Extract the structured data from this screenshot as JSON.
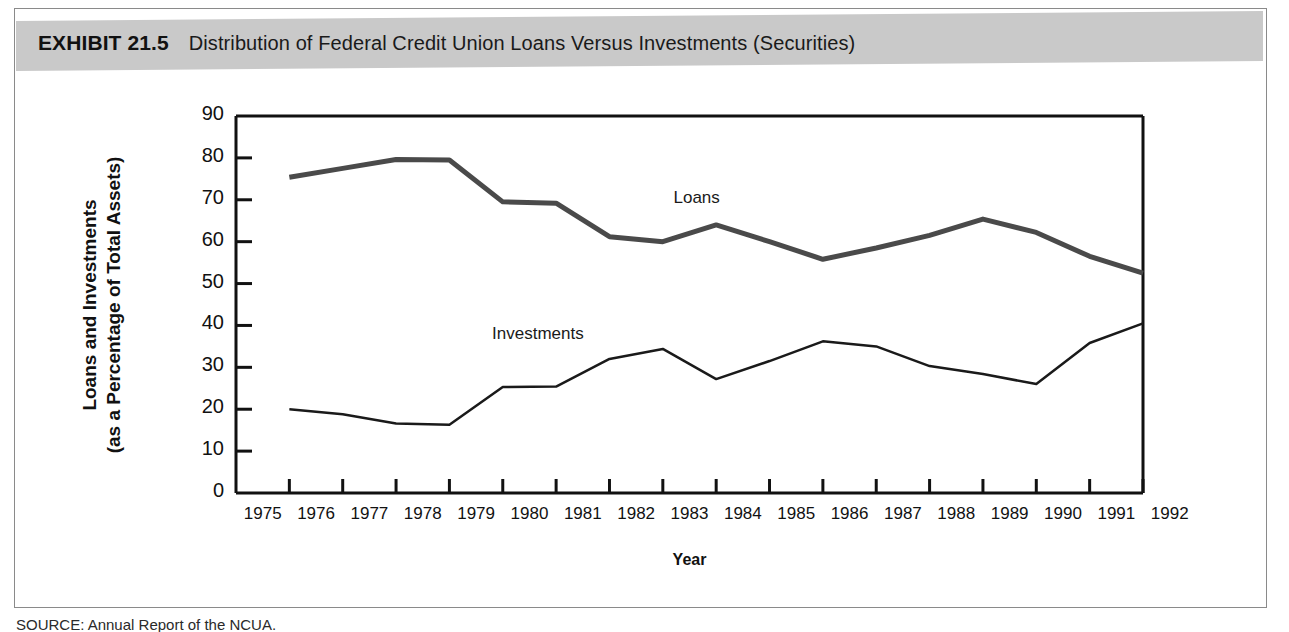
{
  "exhibit": {
    "number": "EXHIBIT 21.5",
    "title": "Distribution of Federal Credit Union Loans Versus Investments (Securities)"
  },
  "source": {
    "text": "SOURCE: Annual Report of the NCUA."
  },
  "chart_data": {
    "type": "line",
    "title": "Distribution of Federal Credit Union Loans Versus Investments (Securities)",
    "xlabel": "Year",
    "ylabel": "Loans and Investments (as a Percentage of Total Assets)",
    "ylabel_line1": "Loans and Investments",
    "ylabel_line2": "(as a Percentage of Total Assets)",
    "xlim": [
      1975,
      1992
    ],
    "ylim": [
      0,
      90
    ],
    "yticks": [
      0,
      10,
      20,
      30,
      40,
      50,
      60,
      70,
      80,
      90
    ],
    "xticks": [
      1975,
      1976,
      1977,
      1978,
      1979,
      1980,
      1981,
      1982,
      1983,
      1984,
      1985,
      1986,
      1987,
      1988,
      1989,
      1990,
      1991,
      1992
    ],
    "grid": false,
    "legend_position": "inline-annotation",
    "categories": [
      1976,
      1977,
      1978,
      1979,
      1980,
      1981,
      1982,
      1983,
      1984,
      1985,
      1986,
      1987,
      1988,
      1989,
      1990,
      1991,
      1992
    ],
    "series": [
      {
        "name": "Loans",
        "color": "#4a4a4a",
        "width": 5,
        "label_x": 1983.2,
        "label_y": 70.5,
        "values": [
          75.4,
          77.5,
          79.6,
          79.5,
          69.5,
          69.2,
          61.2,
          60.0,
          64.0,
          60.0,
          55.8,
          58.5,
          61.5,
          65.4,
          62.2,
          56.5,
          52.5
        ]
      },
      {
        "name": "Investments",
        "color": "#1a1a1a",
        "width": 2.5,
        "label_x": 1979.8,
        "label_y": 38.0,
        "values": [
          20.0,
          18.8,
          16.6,
          16.3,
          25.3,
          25.4,
          32.0,
          34.4,
          27.2,
          31.5,
          36.2,
          35.0,
          30.3,
          28.4,
          26.0,
          35.8,
          40.5
        ]
      }
    ]
  }
}
